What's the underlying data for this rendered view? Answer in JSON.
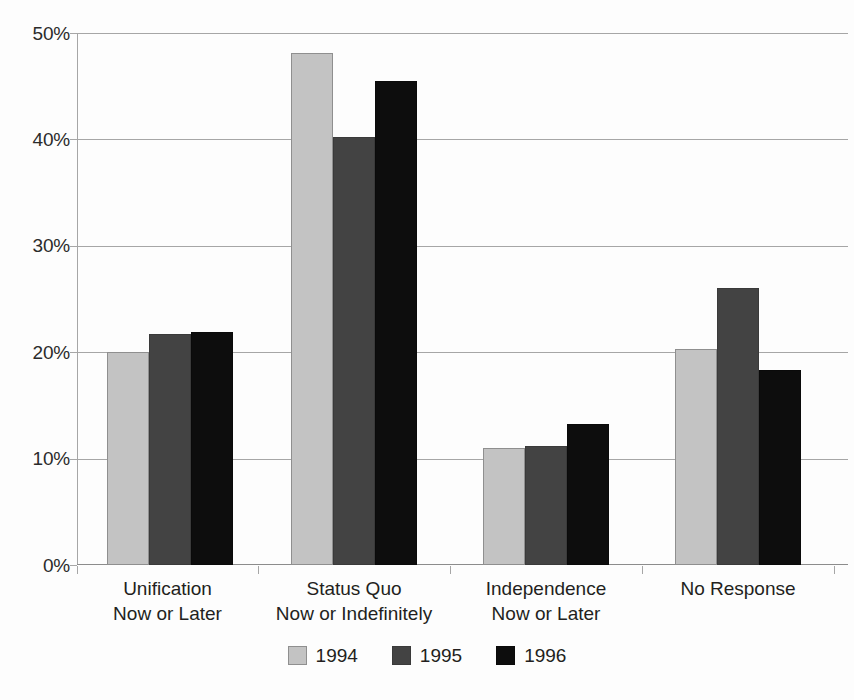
{
  "chart_data": {
    "type": "bar",
    "title": "",
    "subtitle": "",
    "xlabel": "",
    "ylabel": "",
    "ylim": [
      0,
      50
    ],
    "ytick_labels": [
      "0%",
      "10%",
      "20%",
      "30%",
      "40%",
      "50%"
    ],
    "ytick_values": [
      0,
      10,
      20,
      30,
      40,
      50
    ],
    "grid": "horizontal",
    "legend_position": "bottom",
    "categories": [
      "Unification\nNow or Later",
      "Status Quo\nNow or Indefinitely",
      "Independence\nNow or Later",
      "No Response"
    ],
    "category_lines": [
      [
        "Unification",
        "Now or Later"
      ],
      [
        "Status Quo",
        "Now or Indefinitely"
      ],
      [
        "Independence",
        "Now or Later"
      ],
      [
        "No Response"
      ]
    ],
    "series": [
      {
        "name": "1994",
        "color": "#c3c3c3",
        "values": [
          20.0,
          48.1,
          11.0,
          20.3
        ]
      },
      {
        "name": "1995",
        "color": "#434343",
        "values": [
          21.7,
          40.2,
          11.2,
          26.0
        ]
      },
      {
        "name": "1996",
        "color": "#0d0d0d",
        "values": [
          21.9,
          45.5,
          13.3,
          18.3
        ]
      }
    ],
    "units": "percent"
  },
  "legend": {
    "items": [
      {
        "label": "1994"
      },
      {
        "label": "1995"
      },
      {
        "label": "1996"
      }
    ]
  },
  "axis": {
    "y_ticks": [
      {
        "label": "50%"
      },
      {
        "label": "40%"
      },
      {
        "label": "30%"
      },
      {
        "label": "20%"
      },
      {
        "label": "10%"
      },
      {
        "label": "0%"
      }
    ]
  }
}
